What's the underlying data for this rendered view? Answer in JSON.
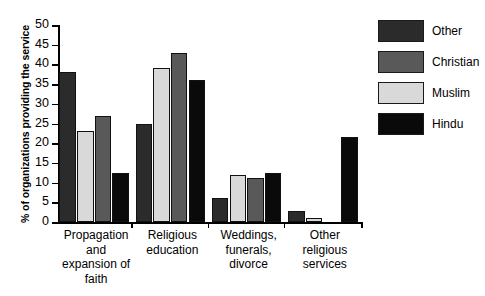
{
  "chart_data": {
    "type": "bar",
    "title": "",
    "subtitle": "",
    "xlabel": "",
    "ylabel": "% of organizations providing the service",
    "ylim": [
      0,
      50
    ],
    "ytick_step": 5,
    "yticks": [
      0,
      5,
      10,
      15,
      20,
      25,
      30,
      35,
      40,
      45,
      50
    ],
    "ytick_labels": [
      "0",
      "5",
      "10",
      "15",
      "20",
      "25",
      "30",
      "35",
      "40",
      "45",
      "50"
    ],
    "grid": false,
    "legend_position": "right",
    "grouping": "grouped",
    "categories": [
      "Propagation\nand\nexpansion of\nfaith",
      "Religious\neducation",
      "Weddings,\nfunerals,\ndivorce",
      "Other\nreligious\nservices"
    ],
    "series": [
      {
        "name": "Other",
        "color": "#2b2b2b",
        "values": [
          38,
          25,
          6,
          2.7
        ]
      },
      {
        "name": "Muslim",
        "color": "#d9d9d9",
        "values": [
          23,
          39,
          12,
          1
        ]
      },
      {
        "name": "Christian",
        "color": "#595959",
        "values": [
          27,
          43,
          11.2,
          0
        ]
      },
      {
        "name": "Hindu",
        "color": "#0a0a0a",
        "values": [
          12.5,
          36,
          12.5,
          21.5
        ]
      }
    ],
    "legend_entries": [
      {
        "label": "Other",
        "color": "#2b2b2b"
      },
      {
        "label": "Christian",
        "color": "#595959"
      },
      {
        "label": "Muslim",
        "color": "#d9d9d9"
      },
      {
        "label": "Hindu",
        "color": "#0a0a0a"
      }
    ]
  }
}
